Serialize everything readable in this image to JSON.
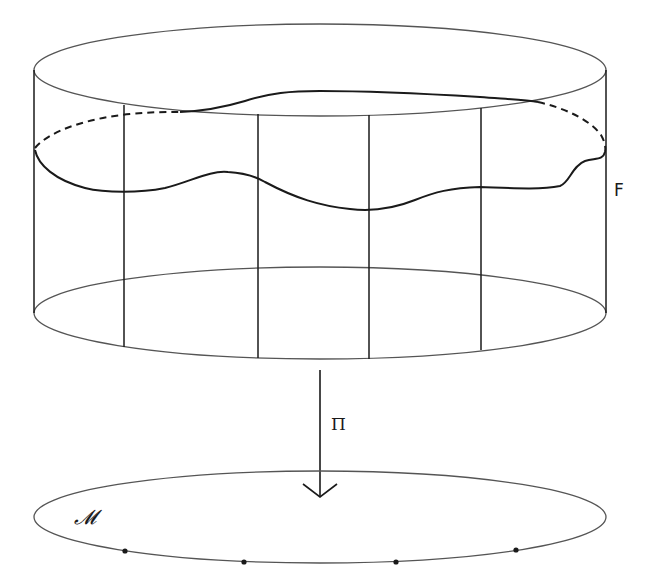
{
  "figure": {
    "labels": {
      "fiber": "F",
      "projection": "Π",
      "base": "𝓜"
    },
    "colors": {
      "stroke": "#1a1a1a",
      "thin_stroke": "#555555",
      "background": "#ffffff"
    },
    "cylinder": {
      "top_ellipse": {
        "cx": 320,
        "cy": 70,
        "rx": 286,
        "ry": 46
      },
      "bottom_ellipse": {
        "cx": 320,
        "cy": 313,
        "rx": 286,
        "ry": 46
      },
      "fiber_lines_x": [
        34,
        124,
        258,
        369,
        481,
        606
      ]
    },
    "section_curve": "wavy closed section across the cylinder; back half dashed where hidden",
    "projection_arrow": {
      "x": 320,
      "y_start": 370,
      "y_end": 497
    },
    "base_ellipse": {
      "cx": 320,
      "cy": 517,
      "rx": 286,
      "ry": 46
    },
    "base_points": [
      [
        125,
        551
      ],
      [
        244,
        562
      ],
      [
        396,
        562
      ],
      [
        516,
        550
      ]
    ]
  }
}
